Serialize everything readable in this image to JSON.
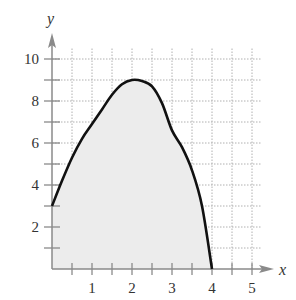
{
  "chart_data": {
    "type": "area",
    "title": "",
    "xlabel": "x",
    "ylabel": "y",
    "xlim": [
      0,
      5.25
    ],
    "ylim": [
      0,
      10.5
    ],
    "x_ticks": [
      1,
      2,
      3,
      4,
      5
    ],
    "x_tick_labels": [
      "1",
      "2",
      "3",
      "4",
      "5"
    ],
    "x_minor_ticks": [
      0.5,
      1.5,
      2.5,
      3.5,
      4.5
    ],
    "y_ticks": [
      2,
      4,
      6,
      8,
      10
    ],
    "y_tick_labels": [
      "2",
      "4",
      "6",
      "8",
      "10"
    ],
    "y_minor_ticks": [
      1,
      3,
      5,
      7,
      9
    ],
    "grid": true,
    "grid_style": "dotted",
    "legend": null,
    "series": [
      {
        "name": "f(x)",
        "x": [
          0,
          0.25,
          0.5,
          0.75,
          1,
          1.25,
          1.5,
          1.75,
          2,
          2.25,
          2.5,
          2.75,
          3,
          3.25,
          3.5,
          3.75,
          4
        ],
        "y": [
          3,
          4.2,
          5.3,
          6.2,
          6.9,
          7.6,
          8.3,
          8.8,
          9,
          8.95,
          8.7,
          7.9,
          6.6,
          5.8,
          4.7,
          3.0,
          0
        ],
        "fill_to_x_axis": true
      }
    ]
  },
  "colors": {
    "curve": "#111111",
    "fill": "#ececec",
    "axis": "#8a8a8a",
    "grid": "#b0b0b0",
    "text": "#333333"
  }
}
